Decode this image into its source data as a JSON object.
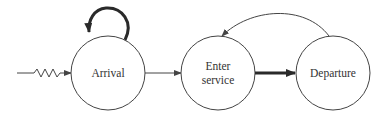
{
  "diagram": {
    "type": "event-graph",
    "colors": {
      "stroke": "#444444",
      "thick_stroke": "#2a2a2a",
      "text": "#333333",
      "background": "#ffffff"
    },
    "nodes": [
      {
        "id": "arrival",
        "label_lines": [
          "Arrival"
        ]
      },
      {
        "id": "enter_service",
        "label_lines": [
          "Enter",
          "service"
        ]
      },
      {
        "id": "departure",
        "label_lines": [
          "Departure"
        ]
      }
    ],
    "edges": [
      {
        "from": "external",
        "to": "arrival",
        "style": "zigzag-thin"
      },
      {
        "from": "arrival",
        "to": "arrival",
        "style": "self-loop-thick"
      },
      {
        "from": "arrival",
        "to": "enter_service",
        "style": "thin"
      },
      {
        "from": "enter_service",
        "to": "departure",
        "style": "thick"
      },
      {
        "from": "departure",
        "to": "enter_service",
        "style": "curved-thin"
      }
    ]
  }
}
